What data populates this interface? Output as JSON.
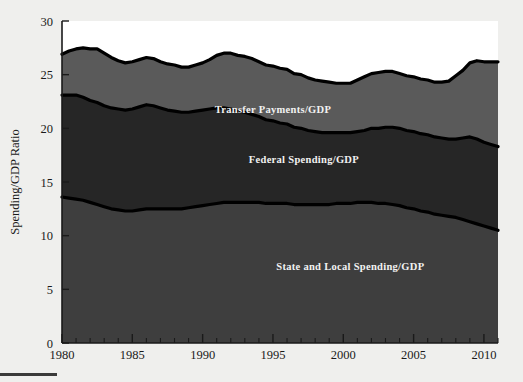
{
  "chart_data": {
    "type": "area",
    "title": "",
    "subtitle": "",
    "xlabel": "",
    "ylabel": "Spending/GDP Ratio",
    "xlim": [
      1980,
      2011
    ],
    "ylim": [
      0,
      30
    ],
    "grid": false,
    "stacked": true,
    "legend": "inline-labels",
    "xticks": [
      1980,
      1985,
      1990,
      1995,
      2000,
      2005,
      2010
    ],
    "xtick_labels": [
      "1980",
      "1985",
      "1990",
      "1995",
      "2000",
      "2005",
      "2010"
    ],
    "yticks": [
      0,
      5,
      10,
      15,
      20,
      25,
      30
    ],
    "ytick_labels": [
      "0",
      "5",
      "10",
      "15",
      "20",
      "25",
      "30"
    ],
    "x": [
      1980,
      1980.5,
      1981,
      1981.5,
      1982,
      1982.5,
      1983,
      1983.5,
      1984,
      1984.5,
      1985,
      1985.5,
      1986,
      1986.5,
      1987,
      1987.5,
      1988,
      1988.5,
      1989,
      1989.5,
      1990,
      1990.5,
      1991,
      1991.5,
      1992,
      1992.5,
      1993,
      1993.5,
      1994,
      1994.5,
      1995,
      1995.5,
      1996,
      1996.5,
      1997,
      1997.5,
      1998,
      1998.5,
      1999,
      1999.5,
      2000,
      2000.5,
      2001,
      2001.5,
      2002,
      2002.5,
      2003,
      2003.5,
      2004,
      2004.5,
      2005,
      2005.5,
      2006,
      2006.5,
      2007,
      2007.5,
      2008,
      2008.5,
      2009,
      2009.5,
      2010,
      2010.5,
      2011
    ],
    "series": [
      {
        "name": "State and Local Spending/GDP",
        "color": "#3e3e3e",
        "label_position": {
          "x": 2000.5,
          "y": 6.8
        },
        "values": [
          13.6,
          13.5,
          13.4,
          13.3,
          13.1,
          12.9,
          12.7,
          12.5,
          12.4,
          12.3,
          12.3,
          12.4,
          12.5,
          12.5,
          12.5,
          12.5,
          12.5,
          12.5,
          12.6,
          12.7,
          12.8,
          12.9,
          13.0,
          13.1,
          13.1,
          13.1,
          13.1,
          13.1,
          13.1,
          13.0,
          13.0,
          13.0,
          13.0,
          12.9,
          12.9,
          12.9,
          12.9,
          12.9,
          12.9,
          13.0,
          13.0,
          13.0,
          13.1,
          13.1,
          13.1,
          13.0,
          13.0,
          12.9,
          12.8,
          12.6,
          12.5,
          12.3,
          12.2,
          12.0,
          11.9,
          11.8,
          11.7,
          11.5,
          11.3,
          11.1,
          10.9,
          10.7,
          10.5
        ]
      },
      {
        "name": "Federal Spending/GDP",
        "color": "#262626",
        "label_position": {
          "x": 1997.2,
          "y": 16.8
        },
        "values": [
          9.5,
          9.6,
          9.7,
          9.6,
          9.5,
          9.5,
          9.4,
          9.4,
          9.4,
          9.4,
          9.5,
          9.6,
          9.7,
          9.6,
          9.4,
          9.2,
          9.1,
          9.0,
          8.9,
          8.9,
          8.9,
          8.9,
          8.9,
          8.8,
          8.7,
          8.5,
          8.4,
          8.2,
          8.0,
          7.8,
          7.7,
          7.5,
          7.4,
          7.2,
          7.1,
          6.9,
          6.8,
          6.7,
          6.7,
          6.6,
          6.6,
          6.6,
          6.6,
          6.7,
          6.9,
          7.0,
          7.1,
          7.2,
          7.2,
          7.2,
          7.2,
          7.2,
          7.2,
          7.2,
          7.2,
          7.2,
          7.3,
          7.6,
          7.9,
          7.9,
          7.8,
          7.8,
          7.8
        ]
      },
      {
        "name": "Transfer Payments/GDP",
        "color": "#5a5a5a",
        "label_position": {
          "x": 1995.0,
          "y": 21.4
        },
        "values": [
          3.8,
          4.1,
          4.3,
          4.6,
          4.8,
          5.0,
          4.9,
          4.7,
          4.5,
          4.4,
          4.4,
          4.4,
          4.4,
          4.4,
          4.3,
          4.3,
          4.3,
          4.2,
          4.2,
          4.3,
          4.4,
          4.6,
          4.9,
          5.1,
          5.2,
          5.2,
          5.2,
          5.2,
          5.1,
          5.1,
          5.1,
          5.1,
          5.1,
          5.0,
          5.0,
          4.9,
          4.8,
          4.8,
          4.7,
          4.6,
          4.6,
          4.6,
          4.8,
          5.0,
          5.1,
          5.2,
          5.2,
          5.2,
          5.1,
          5.1,
          5.1,
          5.1,
          5.1,
          5.1,
          5.2,
          5.4,
          5.9,
          6.3,
          6.9,
          7.3,
          7.5,
          7.7,
          7.9
        ]
      }
    ],
    "totals": [
      26.9,
      27.2,
      27.4,
      27.5,
      27.4,
      27.4,
      27.0,
      26.6,
      26.3,
      26.1,
      26.2,
      26.4,
      26.6,
      26.5,
      26.2,
      26.0,
      25.9,
      25.7,
      25.7,
      25.9,
      26.1,
      26.4,
      26.8,
      27.0,
      27.0,
      26.8,
      26.7,
      26.5,
      26.2,
      25.9,
      25.8,
      25.6,
      25.5,
      25.1,
      25.0,
      24.7,
      24.5,
      24.4,
      24.3,
      24.2,
      24.2,
      24.2,
      24.5,
      24.8,
      25.1,
      25.2,
      25.3,
      25.3,
      25.1,
      24.9,
      24.8,
      24.6,
      24.5,
      24.3,
      24.3,
      24.4,
      24.9,
      25.4,
      26.1,
      26.3,
      26.2,
      26.2,
      26.2
    ]
  },
  "footer": {
    "rule": ""
  }
}
